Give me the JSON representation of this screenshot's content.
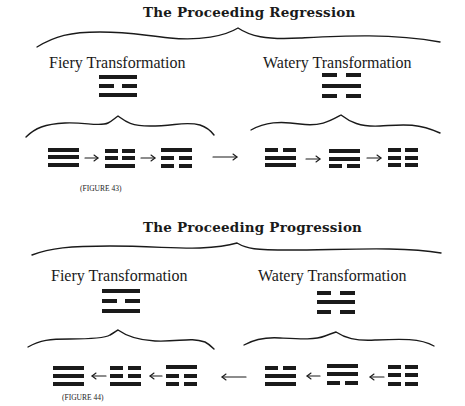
{
  "colors": {
    "ink": "#1a1a1a",
    "background": "#ffffff"
  },
  "figure43": {
    "title": "The Proceeding Regression",
    "caption": "(FIGURE 43)",
    "fiery": {
      "label": "Fiery Transformation",
      "trigram": [
        "solid",
        "broken",
        "solid"
      ]
    },
    "watery": {
      "label": "Watery Transformation",
      "trigram": [
        "broken",
        "solid",
        "broken"
      ]
    },
    "sequence": {
      "arrow_direction": "right",
      "trigrams": [
        [
          "solid",
          "solid",
          "solid"
        ],
        [
          "broken",
          "broken",
          "solid"
        ],
        [
          "solid",
          "broken",
          "broken"
        ],
        [
          "broken",
          "solid",
          "solid"
        ],
        [
          "solid",
          "solid",
          "broken"
        ],
        [
          "broken",
          "broken",
          "broken"
        ]
      ],
      "arrows": [
        "→",
        "→",
        "⟶",
        "→",
        "→"
      ]
    }
  },
  "figure44": {
    "title": "The Proceeding Progression",
    "caption": "(FIGURE 44)",
    "fiery": {
      "label": "Fiery Transformation",
      "trigram": [
        "solid",
        "broken",
        "solid"
      ]
    },
    "watery": {
      "label": "Watery Transformation",
      "trigram": [
        "broken",
        "solid",
        "broken"
      ]
    },
    "sequence": {
      "arrow_direction": "left",
      "trigrams": [
        [
          "solid",
          "solid",
          "solid"
        ],
        [
          "broken",
          "broken",
          "solid"
        ],
        [
          "solid",
          "broken",
          "broken"
        ],
        [
          "broken",
          "solid",
          "solid"
        ],
        [
          "solid",
          "solid",
          "broken"
        ],
        [
          "broken",
          "broken",
          "broken"
        ]
      ],
      "arrows": [
        "←",
        "←",
        "⟵",
        "←",
        "←"
      ]
    }
  }
}
